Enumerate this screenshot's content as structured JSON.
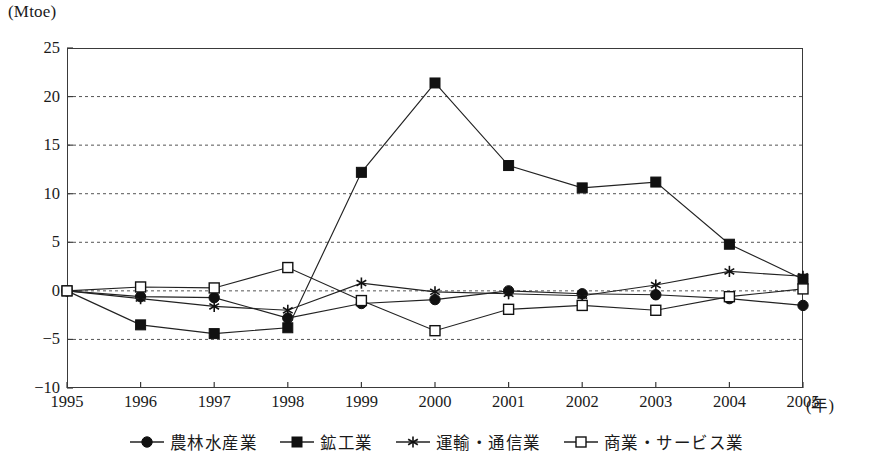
{
  "chart_data": {
    "type": "line",
    "title": "",
    "unit_label": "(Mtoe)",
    "xlabel": "(年)",
    "ylabel": "",
    "grid": true,
    "legend_position": "bottom",
    "x": [
      1995,
      1996,
      1997,
      1998,
      1999,
      2000,
      2001,
      2002,
      2003,
      2004,
      2005
    ],
    "xticklabels": [
      "1995",
      "1996",
      "1997",
      "1998",
      "1999",
      "2000",
      "2001",
      "2002",
      "2003",
      "2004",
      "2005"
    ],
    "yticklabels": [
      "25",
      "20",
      "15",
      "10",
      "5",
      "0",
      "−5",
      "−10"
    ],
    "ytickvalues": [
      25,
      20,
      15,
      10,
      5,
      0,
      -5,
      -10
    ],
    "xlim": [
      1995,
      2005
    ],
    "ylim": [
      -10,
      25
    ],
    "series": [
      {
        "name": "農林水産業",
        "marker": "filled-circle",
        "values": [
          0.0,
          -0.6,
          -0.7,
          -2.8,
          -1.3,
          -0.9,
          0.0,
          -0.3,
          -0.4,
          -0.8,
          -1.5
        ]
      },
      {
        "name": "鉱工業",
        "marker": "filled-square",
        "values": [
          0.0,
          -3.5,
          -4.4,
          -3.8,
          12.2,
          21.4,
          12.9,
          10.6,
          11.2,
          4.8,
          1.2
        ]
      },
      {
        "name": "運輸・通信業",
        "marker": "asterisk",
        "values": [
          0.0,
          -0.8,
          -1.6,
          -2.0,
          0.8,
          -0.1,
          -0.3,
          -0.5,
          0.6,
          2.0,
          1.5
        ]
      },
      {
        "name": "商業・サービス業",
        "marker": "open-square",
        "values": [
          0.0,
          0.4,
          0.3,
          2.4,
          -1.0,
          -4.1,
          -1.9,
          -1.5,
          -2.0,
          -0.6,
          0.2
        ]
      }
    ]
  }
}
